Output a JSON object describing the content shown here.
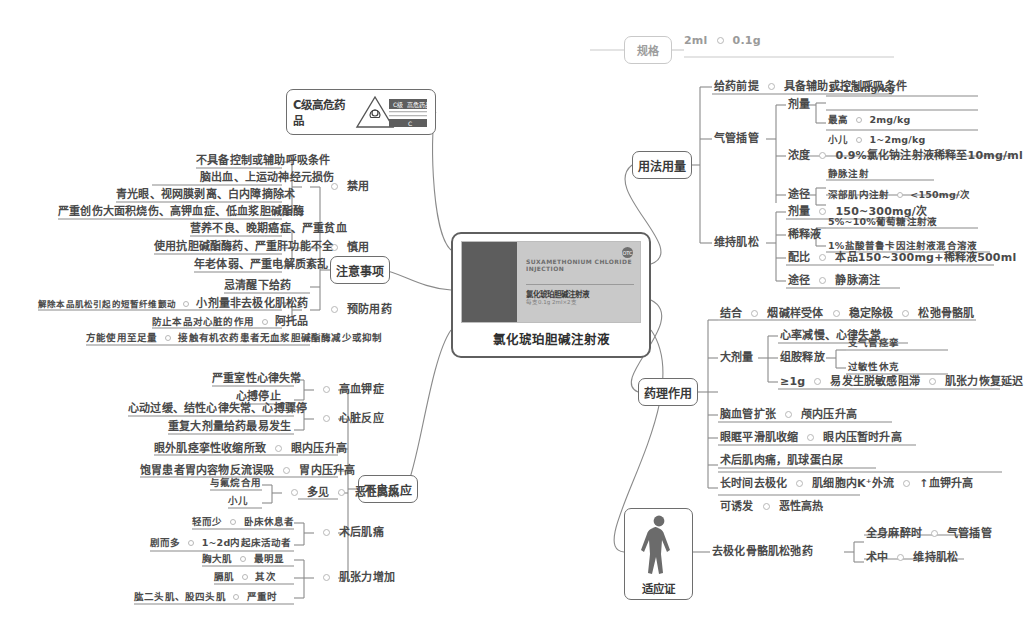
{
  "central": {
    "caption": "氯化琥珀胆碱注射液",
    "package_en": "SUXAMETHONIUM CHLORIDE INJECTION",
    "package_cn": "氯化琥珀胆碱注射液",
    "package_spec": "每支0.1g 2ml×2支",
    "package_badge": "OTC"
  },
  "hazard": {
    "label": "C级高危药品",
    "icon_caption": "C级 高危药品",
    "icon_tag": "C"
  },
  "spec": {
    "label": "规格",
    "value_volume": "2ml",
    "value_mass": "0.1g"
  },
  "usage": {
    "label": "用法用量",
    "premise": {
      "label": "给药前提",
      "value": "具备辅助或控制呼吸条件"
    },
    "intubation": {
      "label": "气管插管",
      "dose": {
        "label": "剂量",
        "standard": "1~1.5mg/kg",
        "max_label": "最高",
        "max_value": "2mg/kg",
        "child_label": "小儿",
        "child_value": "1~2mg/kg"
      },
      "concentration": {
        "label": "浓度",
        "value": "0.9%氯化钠注射液稀释至10mg/ml"
      },
      "route": {
        "label": "途径",
        "iv": "静脉注射",
        "im_label": "深部肌内注射",
        "im_value": "<150mg/次"
      }
    },
    "maintenance": {
      "label": "维持肌松",
      "dose": {
        "label": "剂量",
        "value": "150~300mg/次"
      },
      "diluent": {
        "label": "稀释液",
        "option1": "5%~10%葡萄糖注射液",
        "option2": "1%盐酸普鲁卡因注射液混合溶液"
      },
      "ratio": {
        "label": "配比",
        "value": "本品150~300mg+稀释液500ml"
      },
      "route": {
        "label": "途径",
        "value": "静脉滴注"
      }
    }
  },
  "pharmacology": {
    "label": "药理作用",
    "binding": {
      "label": "结合",
      "v1": "烟碱样受体",
      "v2": "稳定除极",
      "v3": "松弛骨骼肌"
    },
    "high_dose": {
      "label": "大剂量",
      "arrhythmia": "心率减慢、心律失常",
      "histamine": {
        "label": "组胺释放",
        "v1": "支气管痉挛",
        "v2": "过敏性休克"
      },
      "over1g": {
        "label": "≥1g",
        "v1": "易发生脱敏感阻滞",
        "v2": "肌张力恢复延迟"
      }
    },
    "cerebral": {
      "label": "脑血管扩张",
      "value": "颅内压升高"
    },
    "ocular": {
      "label": "眼眶平滑肌收缩",
      "value": "眼内压暂时升高"
    },
    "myalgia": {
      "label": "术后肌肉痛，肌球蛋白尿"
    },
    "depolarization": {
      "label": "长时间去极化",
      "v1": "肌细胞内K⁺外流",
      "v2": "↑血钾升高"
    },
    "induce": {
      "label": "可诱发",
      "value": "恶性高热"
    }
  },
  "indications": {
    "label": "适应证",
    "category": "去极化骨骼肌松弛药",
    "items": [
      {
        "label": "全身麻醉时",
        "value": "气管插管"
      },
      {
        "label": "术中",
        "value": "维持肌松"
      }
    ]
  },
  "precautions": {
    "label": "注意事项",
    "contraindicated": {
      "label": "禁用",
      "items": [
        "不具备控制或辅助呼吸条件",
        "脑出血、上运动神经元损伤",
        "青光眼、视网膜剥离、白内障摘除术",
        "严重创伤大面积烧伤、高钾血症、低血浆胆碱酯酶"
      ]
    },
    "caution": {
      "label": "慎用",
      "items": [
        "营养不良、晚期癌症、严重贫血",
        "使用抗胆碱酯酶药、严重肝功能不全",
        "年老体弱、严重电解质紊乱"
      ]
    },
    "avoid_awake": "忌清醒下给药",
    "prophylaxis": {
      "label": "预防用药",
      "items": [
        {
          "purpose": "解除本品肌松引起的短暂纤维颤动",
          "drug": "小剂量非去极化肌松药"
        },
        {
          "purpose": "防止本品对心脏的作用",
          "drug": "阿托品"
        }
      ]
    },
    "organophosphate": {
      "label": "方能使用至足量",
      "value": "接触有机农药患者无血浆胆碱酯酶减少或抑制"
    }
  },
  "adverse": {
    "label": "不良反应",
    "hyperkalemia": {
      "label": "高血钾症",
      "items": [
        "严重室性心律失常",
        "心搏停止"
      ]
    },
    "cardiac": {
      "label": "心脏反应",
      "items": [
        "心动过缓、结性心律失常、心搏骤停",
        "重复大剂量给药最易发生"
      ]
    },
    "intraocular": {
      "label": "眼内压升高",
      "cause": "眼外肌痉挛性收缩所致"
    },
    "gastric": {
      "label": "胃内压升高",
      "cause": "饱胃患者胃内容物反流误吸"
    },
    "malignant_hyperthermia": {
      "label": "恶性高热",
      "common_label": "多见",
      "items": [
        "与氟烷合用",
        "小儿"
      ]
    },
    "postop_myalgia": {
      "label": "术后肌痛",
      "items": [
        {
          "degree": "轻而少",
          "who": "卧床休息者"
        },
        {
          "degree": "剧而多",
          "who": "1~2d内起床活动者"
        }
      ]
    },
    "muscle_tension": {
      "label": "肌张力增加",
      "items": [
        {
          "site": "胸大肌",
          "degree": "最明显"
        },
        {
          "site": "膈肌",
          "degree": "其次"
        },
        {
          "site": "肱二头肌、股四头肌",
          "degree": "严重时"
        }
      ]
    }
  }
}
